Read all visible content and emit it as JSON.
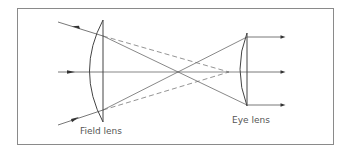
{
  "diagram": {
    "type": "optics-ray-diagram",
    "colors": {
      "frame": "#8a8a8a",
      "line": "#555555",
      "lens": "#444444",
      "arrow": "#333333",
      "background": "#ffffff"
    },
    "labels": {
      "field_lens": "Field lens",
      "eye_lens": "Eye lens"
    },
    "elements": {
      "field_lens": {
        "x": 103,
        "top": 20,
        "bottom": 122,
        "bulge_x": 89
      },
      "eye_lens": {
        "x": 247,
        "top": 33,
        "bottom": 106,
        "bulge_x": 240
      },
      "optical_axis_y": 72,
      "incoming_rays": 3,
      "outgoing_rays": 3,
      "solid_crossing_rays": 2,
      "dashed_rays": 2
    }
  }
}
